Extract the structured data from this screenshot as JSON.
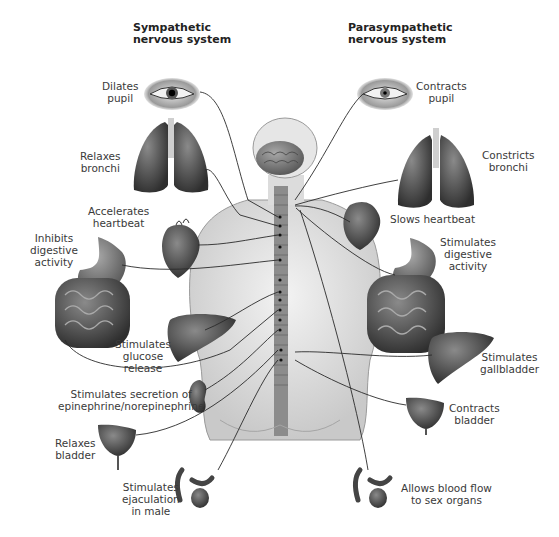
{
  "diagram": {
    "title_left": [
      "Sympathetic",
      "nervous system"
    ],
    "title_right": [
      "Parasympathetic",
      "nervous system"
    ],
    "sympathetic_effects": [
      {
        "organ": "eye",
        "lines": [
          "Dilates",
          "pupil"
        ]
      },
      {
        "organ": "lungs",
        "lines": [
          "Relaxes",
          "bronchi"
        ]
      },
      {
        "organ": "heart",
        "lines": [
          "Accelerates",
          "heartbeat"
        ]
      },
      {
        "organ": "stomach-intestines",
        "lines": [
          "Inhibits",
          "digestive",
          "activity"
        ]
      },
      {
        "organ": "liver",
        "lines": [
          "Stimulates",
          "glucose",
          "release"
        ]
      },
      {
        "organ": "adrenal-kidney",
        "lines": [
          "Stimulates secretion of",
          "epinephrine/norepinephrine"
        ]
      },
      {
        "organ": "bladder",
        "lines": [
          "Relaxes",
          "bladder"
        ]
      },
      {
        "organ": "genitals",
        "lines": [
          "Stimulates",
          "ejaculation",
          "in male"
        ]
      }
    ],
    "parasympathetic_effects": [
      {
        "organ": "eye",
        "lines": [
          "Contracts",
          "pupil"
        ]
      },
      {
        "organ": "lungs",
        "lines": [
          "Constricts",
          "bronchi"
        ]
      },
      {
        "organ": "heart",
        "lines": [
          "Slows heartbeat"
        ]
      },
      {
        "organ": "stomach-intestines",
        "lines": [
          "Stimulates",
          "digestive",
          "activity"
        ]
      },
      {
        "organ": "gallbladder",
        "lines": [
          "Stimulates",
          "gallbladder"
        ]
      },
      {
        "organ": "bladder",
        "lines": [
          "Contracts",
          "bladder"
        ]
      },
      {
        "organ": "genitals",
        "lines": [
          "Allows blood flow",
          "to sex organs"
        ]
      }
    ]
  }
}
